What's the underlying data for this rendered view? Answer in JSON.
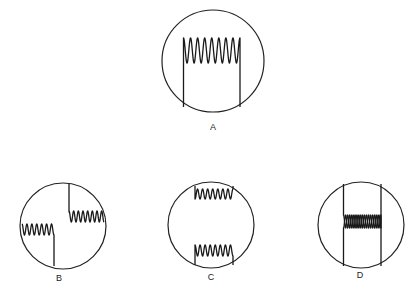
{
  "figure": {
    "panels": [
      {
        "id": "A",
        "label": "A",
        "description": "single trace: two vertical sweeps joined by 8 large oscillations at top",
        "circle": {
          "cx": 213,
          "cy": 61,
          "r": 51
        },
        "label_pos": {
          "x": 213,
          "y": 122
        }
      },
      {
        "id": "B",
        "label": "B",
        "description": "two offset traces: left low oscillation with vertical drop, right high oscillation with vertical rise",
        "circle": {
          "cx": 63,
          "cy": 226,
          "r": 43
        },
        "label_pos": {
          "x": 59,
          "y": 273
        }
      },
      {
        "id": "C",
        "label": "C",
        "description": "two small oscillation traces, one near top and one near bottom of screen",
        "circle": {
          "cx": 211,
          "cy": 225,
          "r": 43
        },
        "label_pos": {
          "x": 211,
          "y": 272
        }
      },
      {
        "id": "D",
        "label": "D",
        "description": "two vertical sweeps with overlapping double oscillation in the middle",
        "circle": {
          "cx": 361,
          "cy": 225,
          "r": 43
        },
        "label_pos": {
          "x": 360,
          "y": 270
        }
      }
    ],
    "colors": {
      "line": "#1a1a1a",
      "background": "#ffffff"
    }
  }
}
